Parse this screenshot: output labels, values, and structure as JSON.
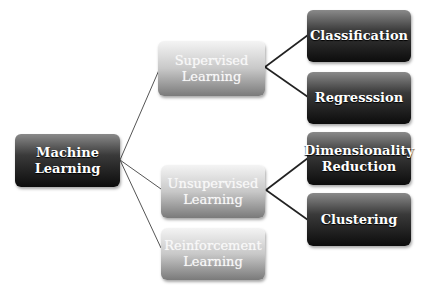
{
  "diagram": {
    "type": "tree",
    "root": {
      "id": "ml",
      "label_line1": "Machine",
      "label_line2": "Learning"
    },
    "level1": [
      {
        "id": "sup",
        "label_line1": "Supervised",
        "label_line2": "Learning"
      },
      {
        "id": "unsup",
        "label_line1": "Unsupervised",
        "label_line2": "Learning"
      },
      {
        "id": "rl",
        "label_line1": "Reinforcement",
        "label_line2": "Learning"
      }
    ],
    "level2": [
      {
        "id": "cls",
        "parent": "sup",
        "label_line1": "Classification",
        "label_line2": ""
      },
      {
        "id": "reg",
        "parent": "sup",
        "label_line1": "Regresssion",
        "label_line2": ""
      },
      {
        "id": "dim",
        "parent": "unsup",
        "label_line1": "Dimensionality",
        "label_line2": "Reduction"
      },
      {
        "id": "clu",
        "parent": "unsup",
        "label_line1": "Clustering",
        "label_line2": ""
      }
    ],
    "edges": [
      [
        "ml",
        "sup"
      ],
      [
        "ml",
        "unsup"
      ],
      [
        "ml",
        "rl"
      ],
      [
        "sup",
        "cls"
      ],
      [
        "sup",
        "reg"
      ],
      [
        "unsup",
        "dim"
      ],
      [
        "unsup",
        "clu"
      ]
    ],
    "colors": {
      "dark_node": "#1a1a1a",
      "light_node": "#b8b8b8",
      "line": "#444444"
    }
  }
}
